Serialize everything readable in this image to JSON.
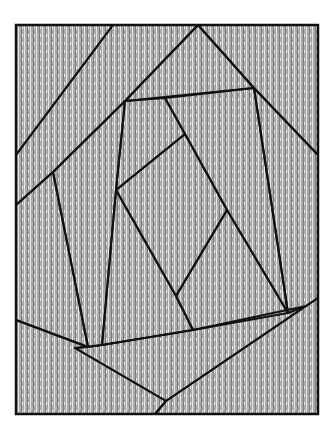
{
  "artwork": {
    "type": "patterned-quilt-illustration",
    "palette": {
      "background": "#ffffff",
      "outline": "#111111",
      "light_gray": "#bdbdbd",
      "mid_gray": "#8f8f8f",
      "dark_gray": "#5a5a5a",
      "charcoal": "#3e3e3e",
      "speckle": "#9a9a9a"
    },
    "patches": [
      {
        "name": "top-left-streak-patch",
        "pattern": "vertical-streaks"
      },
      {
        "name": "diagonal-dotted-stripe",
        "pattern": "fine-dots"
      },
      {
        "name": "top-center-streak-patch",
        "pattern": "vertical-streaks"
      },
      {
        "name": "top-right-crosshatch-patch",
        "pattern": "dense-grid"
      },
      {
        "name": "left-wedge-streak-patch",
        "pattern": "dark-vertical-streaks"
      },
      {
        "name": "left-stipple-patch",
        "pattern": "stipple"
      },
      {
        "name": "center-streak-patch",
        "pattern": "vertical-streaks"
      },
      {
        "name": "center-dark-diamond",
        "pattern": "dark-solid-grid"
      },
      {
        "name": "center-herringbone-patch",
        "pattern": "herringbone"
      },
      {
        "name": "right-squiggle-patch",
        "pattern": "squiggles"
      },
      {
        "name": "center-squiggle-patch",
        "pattern": "squiggles"
      },
      {
        "name": "lower-right-plaid-patch",
        "pattern": "plaid"
      },
      {
        "name": "bottom-herringbone-band",
        "pattern": "herringbone"
      },
      {
        "name": "bottom-left-blob-patch",
        "pattern": "blobs"
      },
      {
        "name": "bottom-right-plaid-patch",
        "pattern": "plaid"
      }
    ]
  }
}
